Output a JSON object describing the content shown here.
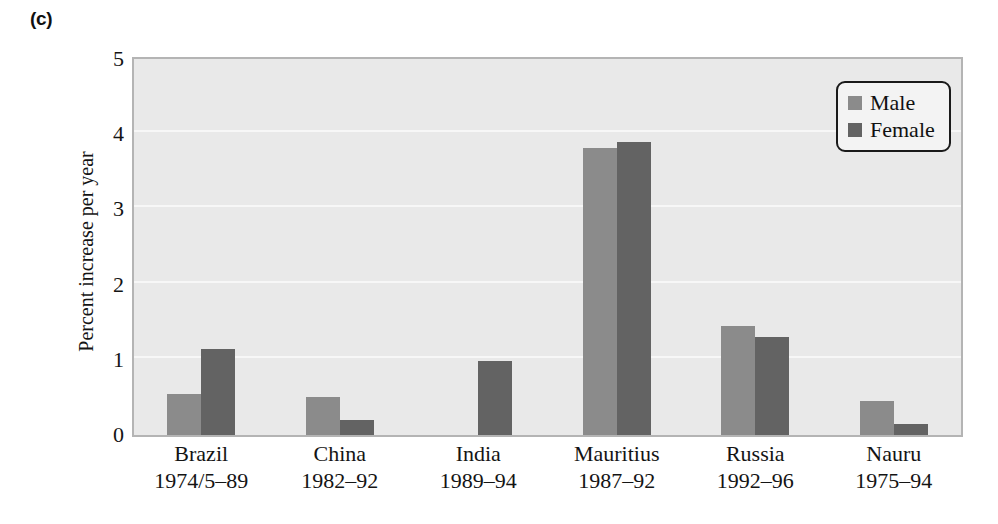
{
  "figure": {
    "panel_label": "(c)"
  },
  "chart_data": {
    "type": "bar",
    "title": "",
    "xlabel": "",
    "ylabel": "Percent increase per year",
    "ylim": [
      0,
      5
    ],
    "ytick_labels": [
      "0",
      "1",
      "2",
      "3",
      "4",
      "5"
    ],
    "yticks": [
      0,
      1,
      2,
      3,
      4,
      5
    ],
    "grid": true,
    "legend_position": "top-right",
    "categories": [
      "Brazil",
      "China",
      "India",
      "Mauritius",
      "Russia",
      "Nauru"
    ],
    "category_periods": [
      "1974/5–89",
      "1982–92",
      "1989–94",
      "1987–92",
      "1992–96",
      "1975–94"
    ],
    "series": [
      {
        "name": "Male",
        "color": "#8b8b8b",
        "values": [
          0.55,
          0.5,
          null,
          3.82,
          1.45,
          0.45
        ]
      },
      {
        "name": "Female",
        "color": "#636363",
        "values": [
          1.15,
          0.2,
          0.98,
          3.9,
          1.3,
          0.15
        ]
      }
    ]
  },
  "legend": {
    "items": [
      {
        "label": "Male",
        "swatch": "male-swatch"
      },
      {
        "label": "Female",
        "swatch": "female-swatch"
      }
    ]
  }
}
